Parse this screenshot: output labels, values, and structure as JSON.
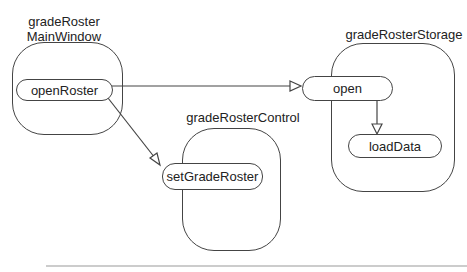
{
  "diagram": {
    "objects": [
      {
        "id": "main",
        "title_line1": "gradeRoster",
        "title_line2": "MainWindow",
        "methods": [
          "openRoster"
        ]
      },
      {
        "id": "control",
        "title": "gradeRosterControl",
        "methods": [
          "setGradeRoster"
        ]
      },
      {
        "id": "storage",
        "title": "gradeRosterStorage",
        "methods": [
          "open",
          "loadData"
        ]
      }
    ],
    "edges": [
      {
        "from": "openRoster",
        "to": "open"
      },
      {
        "from": "openRoster",
        "to": "setGradeRoster"
      },
      {
        "from": "open",
        "to": "loadData"
      }
    ],
    "colors": {
      "stroke": "#444444",
      "background": "#ffffff",
      "rule": "#999999"
    }
  }
}
